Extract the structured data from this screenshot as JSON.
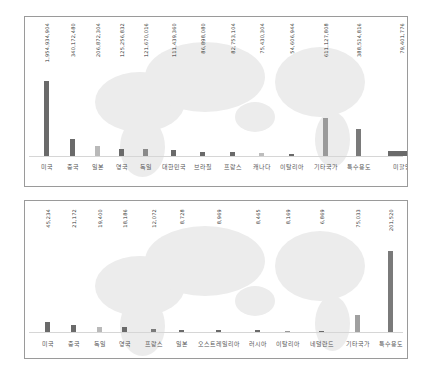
{
  "chart_data": [
    {
      "type": "bar",
      "title": "",
      "xlabel": "",
      "ylabel": "",
      "grid": false,
      "legend": null,
      "background": "world-map",
      "categories": [
        "미국",
        "중국",
        "일본",
        "영국",
        "독일",
        "대한민국",
        "브라질",
        "프랑스",
        "캐나다",
        "이탈리아",
        "기타국가",
        "특수용도",
        "미할당"
      ],
      "values": [
        1954934904,
        340172480,
        206872304,
        125256832,
        121670016,
        111439360,
        86898080,
        82753104,
        75430304,
        54606944,
        611127808,
        388514816,
        79401776
      ],
      "value_labels": [
        "1,954,934,904",
        "340,172,480",
        "206,872,304",
        "125,256,832",
        "121,670,016",
        "111,439,360",
        "86,898,080",
        "82,753,104",
        "75,430,304",
        "54,606,944",
        "611,127,808",
        "388,514,816",
        "79,401,776"
      ],
      "colors": [
        "#6a6a6a",
        "#6a6a6a",
        "#b9b9b9",
        "#6a6a6a",
        "#8a8a8a",
        "#6a6a6a",
        "#6a6a6a",
        "#6a6a6a",
        "#bdbdbd",
        "#6a6a6a",
        "#9a9a9a",
        "#7a7a7a",
        "#6a6a6a"
      ]
    },
    {
      "type": "bar",
      "title": "",
      "xlabel": "",
      "ylabel": "",
      "grid": false,
      "legend": null,
      "background": "world-map",
      "categories": [
        "미국",
        "중국",
        "독일",
        "영국",
        "프랑스",
        "일본",
        "오스트레일리아",
        "러시아",
        "이탈리아",
        "네덜란드",
        "기타국가",
        "특수용도"
      ],
      "values": [
        45234,
        21172,
        19400,
        18186,
        12072,
        8728,
        8969,
        8465,
        8169,
        6869,
        75033,
        201520
      ],
      "value_labels": [
        "45,234",
        "21,172",
        "19,400",
        "18,186",
        "12,072",
        "8,728",
        "8,969",
        "8,465",
        "8,169",
        "6,869",
        "75,033",
        "201,520"
      ],
      "colors": [
        "#6a6a6a",
        "#6a6a6a",
        "#b9b9b9",
        "#6a6a6a",
        "#7a7a7a",
        "#6a6a6a",
        "#6a6a6a",
        "#6a6a6a",
        "#9a9a9a",
        "#6a6a6a",
        "#a0a0a0",
        "#7a7a7a"
      ]
    }
  ],
  "layout": {
    "chart1": {
      "x": [
        19,
        45,
        70,
        94,
        118,
        146,
        175,
        205,
        234,
        264,
        298,
        331,
        363
      ],
      "bar_widths": [
        5,
        5,
        5,
        5,
        5,
        5,
        5,
        5,
        5,
        5,
        5,
        5,
        27
      ],
      "bar_tops": [
        64,
        122,
        129,
        132,
        132,
        133,
        135,
        135,
        136,
        137,
        101,
        112,
        134
      ],
      "baseline": 139
    },
    "chart2": {
      "x": [
        20,
        46,
        72,
        97,
        126,
        154,
        191,
        230,
        260,
        294,
        330,
        363
      ],
      "bar_widths": [
        5,
        5,
        5,
        5,
        5,
        5,
        5,
        5,
        5,
        5,
        5,
        5
      ],
      "bar_tops": [
        121,
        124,
        126,
        126,
        128,
        129,
        129,
        129,
        130,
        130,
        114,
        50
      ],
      "baseline": 131
    }
  }
}
